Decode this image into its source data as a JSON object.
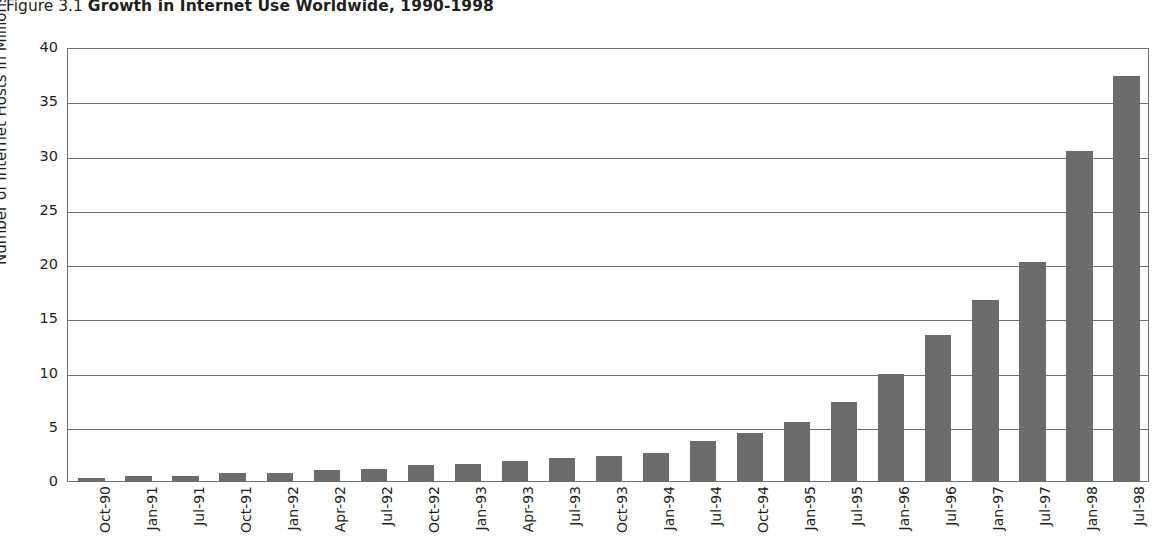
{
  "title": {
    "figure_number": "Figure 3.1",
    "figure_name": "Growth in Internet Use Worldwide, 1990-1998"
  },
  "chart_data": {
    "type": "bar",
    "title": "Growth in Internet Use Worldwide, 1990-1998",
    "xlabel": "",
    "ylabel": "Number of Internet Hosts in Millions",
    "ylim": [
      0,
      40
    ],
    "ytick_labels": [
      "0",
      "5",
      "10",
      "15",
      "20",
      "25",
      "30",
      "35",
      "40"
    ],
    "ytick_values": [
      0,
      5,
      10,
      15,
      20,
      25,
      30,
      35,
      40
    ],
    "grid": "horizontal",
    "legend": "none",
    "bar_color": "#6b6b6b",
    "categories": [
      "Oct-90",
      "Jan-91",
      "Jul-91",
      "Oct-91",
      "Jan-92",
      "Apr-92",
      "Jul-92",
      "Oct-92",
      "Jan-93",
      "Apr-93",
      "Jul-93",
      "Oct-93",
      "Jan-94",
      "Jul-94",
      "Oct-94",
      "Jan-95",
      "Jul-95",
      "Jan-96",
      "Jul-96",
      "Jan-97",
      "Jul-97",
      "Jan-98",
      "Jul-98"
    ],
    "values": [
      0.3,
      0.5,
      0.5,
      0.75,
      0.75,
      1.05,
      1.1,
      1.5,
      1.6,
      1.85,
      2.15,
      2.35,
      2.6,
      3.7,
      4.4,
      5.4,
      7.3,
      9.9,
      13.5,
      16.7,
      20.2,
      30.4,
      37.3
    ]
  }
}
